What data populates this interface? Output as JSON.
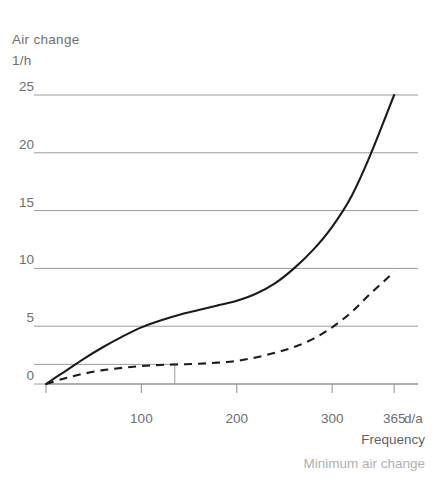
{
  "chart_data": {
    "type": "line",
    "title": "",
    "ylabel": "Air change",
    "yunit": "1/h",
    "xlabel": "Frequency",
    "xunit": "d/a",
    "grid": true,
    "legend_position": "none",
    "xlim": [
      0,
      390
    ],
    "ylim": [
      0,
      25
    ],
    "xticks": [
      0,
      100,
      200,
      300,
      365
    ],
    "xtick_labels": [
      "",
      "100",
      "200",
      "300",
      "365"
    ],
    "yticks": [
      0,
      5,
      10,
      15,
      20,
      25
    ],
    "ytick_labels": [
      "0",
      "5",
      "10",
      "15",
      "20",
      "25"
    ],
    "annotations": [
      {
        "name": "minimum-air-change-reference",
        "label": "Minimum air change",
        "y_value": 1.7,
        "x_value": 135
      }
    ],
    "series": [
      {
        "name": "Air change",
        "style": "solid",
        "color": "#1b1b1b",
        "x": [
          0,
          20,
          40,
          60,
          80,
          100,
          120,
          140,
          160,
          180,
          200,
          220,
          240,
          260,
          280,
          300,
          320,
          340,
          365
        ],
        "y": [
          0.0,
          1.1,
          2.2,
          3.2,
          4.1,
          4.9,
          5.5,
          6.0,
          6.4,
          6.8,
          7.2,
          7.8,
          8.7,
          10.0,
          11.6,
          13.6,
          16.2,
          19.8,
          25.0
        ]
      },
      {
        "name": "Minimum air change",
        "style": "dashed",
        "color": "#1b1b1b",
        "x": [
          0,
          20,
          40,
          60,
          80,
          100,
          120,
          140,
          160,
          180,
          200,
          220,
          240,
          260,
          280,
          300,
          320,
          340,
          365
        ],
        "y": [
          0.0,
          0.5,
          0.9,
          1.2,
          1.4,
          1.55,
          1.65,
          1.7,
          1.75,
          1.85,
          2.0,
          2.3,
          2.7,
          3.2,
          3.9,
          4.9,
          6.2,
          7.8,
          9.7
        ]
      }
    ]
  },
  "axes": {
    "ylabel_line1": "Air change",
    "ylabel_line2": "1/h"
  },
  "captions": {
    "frequency": "Frequency",
    "minimum_air_change": "Minimum air change"
  }
}
